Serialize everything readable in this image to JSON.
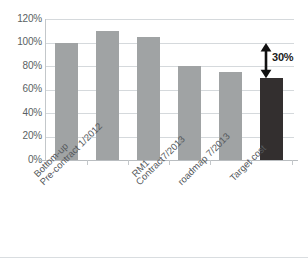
{
  "chart_data": {
    "type": "bar",
    "title": "",
    "subtitle": "",
    "xlabel": "",
    "ylabel": "",
    "categories": [
      "Bottom-up",
      "Pre-contract 1/2012",
      "RM1",
      "Contract7/2013",
      "roadmap 7/2013",
      "Target cost"
    ],
    "values": [
      100,
      110,
      105,
      80,
      75,
      70
    ],
    "value_unit": "%",
    "ylim": [
      0,
      120
    ],
    "ytick_labels": [
      "0%",
      "20%",
      "40%",
      "60%",
      "80%",
      "100%",
      "120%"
    ],
    "ytick_values": [
      0,
      20,
      40,
      60,
      80,
      100,
      120
    ],
    "grid": true,
    "legend": "none",
    "bar_colors": [
      "#a0a3a4",
      "#a0a3a4",
      "#a0a3a4",
      "#a0a3a4",
      "#a0a3a4",
      "#332f2f"
    ],
    "highlight_color": "#332f2f",
    "series_color": "#a0a3a4",
    "annotations": [
      {
        "label": "30%",
        "type": "double-headed-arrow",
        "from_value": 70,
        "to_value": 100,
        "at_category": "Target cost"
      }
    ]
  },
  "axis": {
    "y_ticks": [
      {
        "label": "120%",
        "value": 120
      },
      {
        "label": "100%",
        "value": 100
      },
      {
        "label": "80%",
        "value": 80
      },
      {
        "label": "60%",
        "value": 60
      },
      {
        "label": "40%",
        "value": 40
      },
      {
        "label": "20%",
        "value": 20
      },
      {
        "label": "0%",
        "value": 0
      }
    ]
  },
  "annotation": {
    "gap_label": "30%"
  }
}
